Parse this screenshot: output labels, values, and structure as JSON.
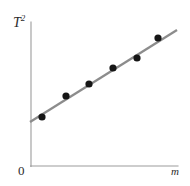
{
  "figure": {
    "background_color": "#ffffff",
    "width": 190,
    "height": 186,
    "origin_label": "0",
    "ylabel_base": "T",
    "ylabel_exponent": "2",
    "xlabel": "m"
  },
  "chart_data": {
    "type": "scatter",
    "title": "",
    "subtitle": "",
    "xlabel": "m",
    "ylabel": "T²",
    "ylabel_base": "T",
    "ylabel_exponent": "2",
    "origin_label": "0",
    "grid": false,
    "legend": false,
    "axis_tick_labels": [],
    "annotations": [],
    "axes": {
      "x_axis_from": [
        31,
        166
      ],
      "x_axis_to": [
        178,
        166
      ],
      "y_axis_from": [
        31,
        22
      ],
      "y_axis_to": [
        31,
        166
      ],
      "axis_color": "#9c9c9c",
      "x_range_shown": "0 to unlabeled maximum",
      "y_range_shown": "0 to unlabeled maximum"
    },
    "points_pixel": [
      {
        "x": 42,
        "y": 117
      },
      {
        "x": 66,
        "y": 96
      },
      {
        "x": 89,
        "y": 84
      },
      {
        "x": 113,
        "y": 68
      },
      {
        "x": 137,
        "y": 58
      },
      {
        "x": 158,
        "y": 38
      }
    ],
    "point_color": "#161616",
    "point_radius": 3.6,
    "x": [
      0.075,
      0.238,
      0.395,
      0.558,
      0.721,
      0.864
    ],
    "y": [
      0.34,
      0.486,
      0.569,
      0.681,
      0.75,
      0.889
    ],
    "series": [
      {
        "name": "measured data",
        "x": [
          0.075,
          0.238,
          0.395,
          0.558,
          0.721,
          0.864
        ],
        "y": [
          0.34,
          0.486,
          0.569,
          0.681,
          0.75,
          0.889
        ]
      }
    ],
    "fit_line": {
      "name": "best-fit line",
      "color": "#8c8c8c",
      "width": 2.3,
      "start_pixel": [
        30,
        122
      ],
      "end_pixel": [
        177,
        30
      ],
      "intercept": 0.306,
      "slope": 0.681
    },
    "xlim": [
      0,
      1
    ],
    "ylim": [
      0,
      1
    ]
  }
}
